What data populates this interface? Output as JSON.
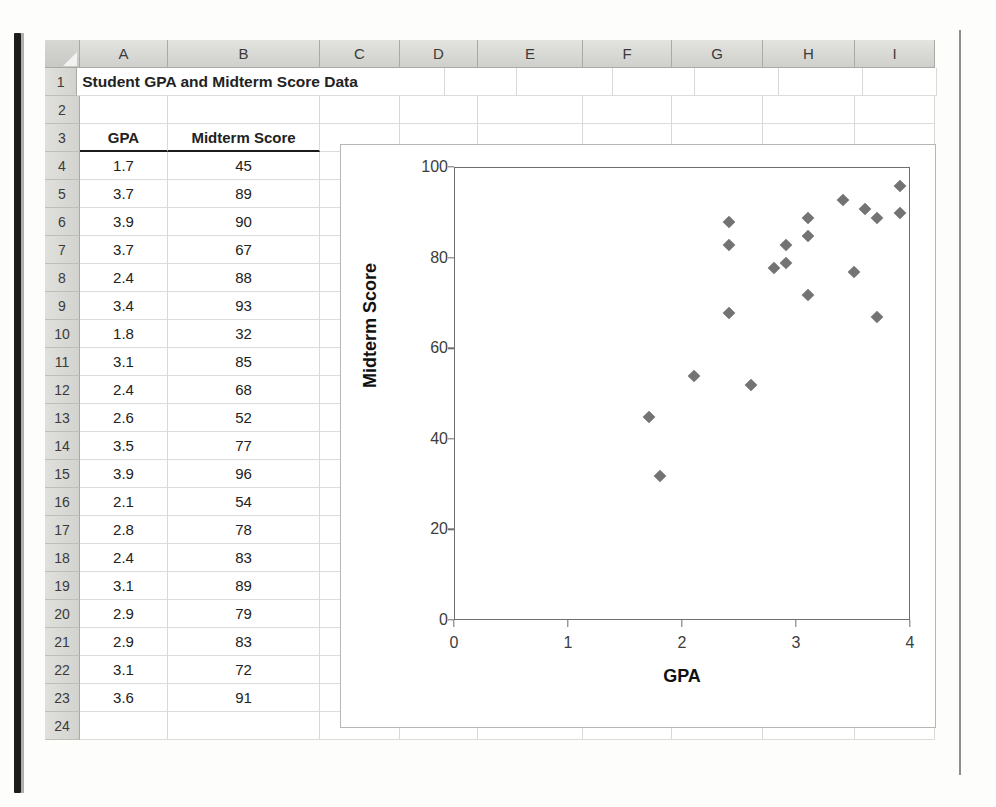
{
  "spreadsheet": {
    "column_headers": [
      "A",
      "B",
      "C",
      "D",
      "E",
      "F",
      "G",
      "H",
      "I"
    ],
    "row_numbers": [
      "1",
      "2",
      "3",
      "4",
      "5",
      "6",
      "7",
      "8",
      "9",
      "10",
      "11",
      "12",
      "13",
      "14",
      "15",
      "16",
      "17",
      "18",
      "19",
      "20",
      "21",
      "22",
      "23",
      "24"
    ],
    "title_cell": "Student GPA and Midterm Score Data",
    "table_headers": {
      "gpa": "GPA",
      "midterm": "Midterm Score"
    },
    "rows": [
      {
        "row": "4",
        "gpa": "1.7",
        "score": "45"
      },
      {
        "row": "5",
        "gpa": "3.7",
        "score": "89"
      },
      {
        "row": "6",
        "gpa": "3.9",
        "score": "90"
      },
      {
        "row": "7",
        "gpa": "3.7",
        "score": "67"
      },
      {
        "row": "8",
        "gpa": "2.4",
        "score": "88"
      },
      {
        "row": "9",
        "gpa": "3.4",
        "score": "93"
      },
      {
        "row": "10",
        "gpa": "1.8",
        "score": "32"
      },
      {
        "row": "11",
        "gpa": "3.1",
        "score": "85"
      },
      {
        "row": "12",
        "gpa": "2.4",
        "score": "68"
      },
      {
        "row": "13",
        "gpa": "2.6",
        "score": "52"
      },
      {
        "row": "14",
        "gpa": "3.5",
        "score": "77"
      },
      {
        "row": "15",
        "gpa": "3.9",
        "score": "96"
      },
      {
        "row": "16",
        "gpa": "2.1",
        "score": "54"
      },
      {
        "row": "17",
        "gpa": "2.8",
        "score": "78"
      },
      {
        "row": "18",
        "gpa": "2.4",
        "score": "83"
      },
      {
        "row": "19",
        "gpa": "3.1",
        "score": "89"
      },
      {
        "row": "20",
        "gpa": "2.9",
        "score": "79"
      },
      {
        "row": "21",
        "gpa": "2.9",
        "score": "83"
      },
      {
        "row": "22",
        "gpa": "3.1",
        "score": "72"
      },
      {
        "row": "23",
        "gpa": "3.6",
        "score": "91"
      }
    ]
  },
  "chart_data": {
    "type": "scatter",
    "title": "",
    "xlabel": "GPA",
    "ylabel": "Midterm Score",
    "xlim": [
      0,
      4
    ],
    "ylim": [
      0,
      100
    ],
    "xticks": [
      "0",
      "1",
      "2",
      "3",
      "4"
    ],
    "yticks": [
      "0",
      "20",
      "40",
      "60",
      "80",
      "100"
    ],
    "grid": false,
    "legend": false,
    "marker": "diamond",
    "marker_color": "#737373",
    "series": [
      {
        "name": "Midterm Score",
        "points": [
          {
            "x": 1.7,
            "y": 45
          },
          {
            "x": 3.7,
            "y": 89
          },
          {
            "x": 3.9,
            "y": 90
          },
          {
            "x": 3.7,
            "y": 67
          },
          {
            "x": 2.4,
            "y": 88
          },
          {
            "x": 3.4,
            "y": 93
          },
          {
            "x": 1.8,
            "y": 32
          },
          {
            "x": 3.1,
            "y": 85
          },
          {
            "x": 2.4,
            "y": 68
          },
          {
            "x": 2.6,
            "y": 52
          },
          {
            "x": 3.5,
            "y": 77
          },
          {
            "x": 3.9,
            "y": 96
          },
          {
            "x": 2.1,
            "y": 54
          },
          {
            "x": 2.8,
            "y": 78
          },
          {
            "x": 2.4,
            "y": 83
          },
          {
            "x": 3.1,
            "y": 89
          },
          {
            "x": 2.9,
            "y": 79
          },
          {
            "x": 2.9,
            "y": 83
          },
          {
            "x": 3.1,
            "y": 72
          },
          {
            "x": 3.6,
            "y": 91
          }
        ]
      }
    ]
  }
}
